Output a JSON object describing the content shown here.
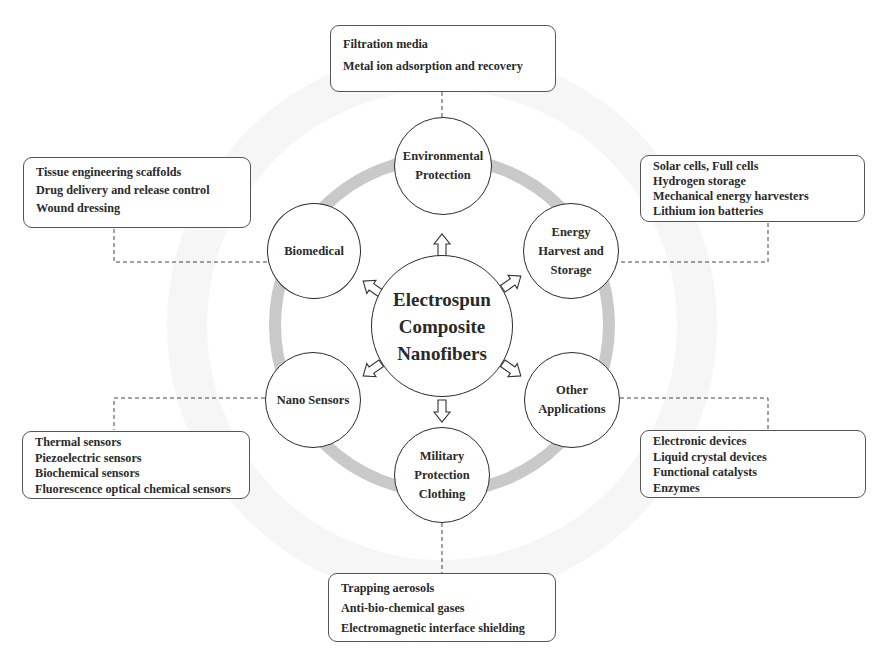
{
  "diagram": {
    "center": {
      "lines": [
        "Electrospun",
        "Composite",
        "Nanofibers"
      ]
    },
    "nodes": [
      {
        "id": "environmental",
        "lines": [
          "Environmental",
          "Protection"
        ]
      },
      {
        "id": "energy",
        "lines": [
          "Energy",
          "Harvest and",
          "Storage"
        ]
      },
      {
        "id": "other",
        "lines": [
          "Other",
          "Applications"
        ]
      },
      {
        "id": "military",
        "lines": [
          "Military",
          "Protection",
          "Clothing"
        ]
      },
      {
        "id": "nano-sensors",
        "lines": [
          "Nano Sensors"
        ]
      },
      {
        "id": "biomedical",
        "lines": [
          "Biomedical"
        ]
      }
    ],
    "boxes": {
      "environmental": [
        "Filtration media",
        "Metal ion adsorption and recovery"
      ],
      "energy": [
        "Solar cells, Full cells",
        "Hydrogen storage",
        "Mechanical energy harvesters",
        "Lithium ion batteries"
      ],
      "other": [
        "Electronic devices",
        "Liquid crystal devices",
        "Functional catalysts",
        "Enzymes"
      ],
      "military": [
        "Trapping aerosols",
        "Anti-bio-chemical gases",
        "Electromagnetic interface shielding"
      ],
      "nano_sensors": [
        "Thermal sensors",
        "Piezoelectric sensors",
        "Biochemical sensors",
        "Fluorescence optical chemical sensors"
      ],
      "biomedical": [
        "Tissue engineering scaffolds",
        "Drug delivery and release control",
        "Wound dressing"
      ]
    },
    "colors": {
      "ring": "#c9c9c9",
      "outline": "#2b2b2b",
      "connector": "#444444"
    }
  }
}
